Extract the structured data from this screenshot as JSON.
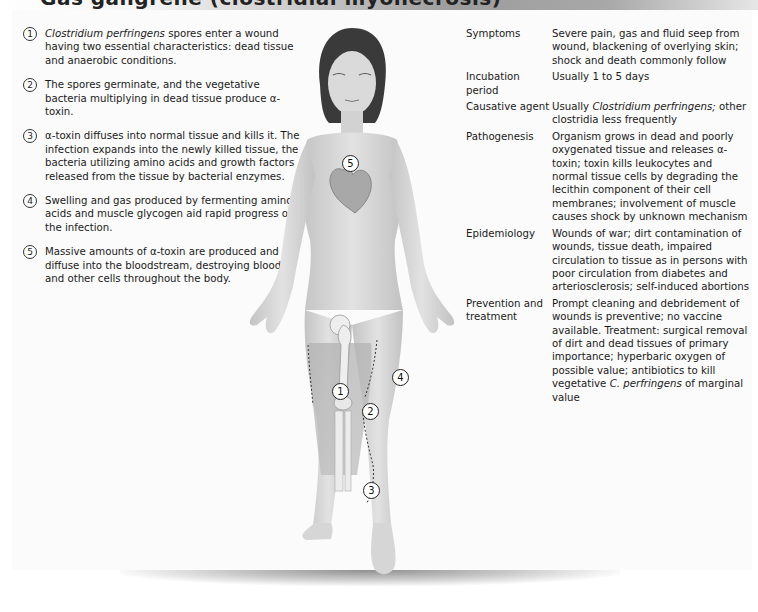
{
  "header": {
    "title": "Gas gangrene (clostridial myonecrosis)"
  },
  "steps": [
    {
      "num": "1",
      "italic": "Clostridium perfringens",
      "text": " spores enter a wound having two essential characteristics: dead tissue and anaerobic conditions."
    },
    {
      "num": "2",
      "italic": "",
      "text": "The spores germinate, and the vegetative bacteria multiplying in dead tissue produce α-toxin."
    },
    {
      "num": "3",
      "italic": "",
      "text": "α-toxin diffuses into normal tissue and kills it. The infection expands into the newly killed tissue, the bacteria utilizing amino acids and growth factors released from the tissue by bacterial enzymes."
    },
    {
      "num": "4",
      "italic": "",
      "text": "Swelling and gas produced by fermenting amino acids and muscle glycogen aid rapid progress of the infection."
    },
    {
      "num": "5",
      "italic": "",
      "text": "Massive amounts of α-toxin are produced and diffuse into the bloodstream, destroying blood and other cells throughout the body."
    }
  ],
  "info": [
    {
      "label": "Symptoms",
      "value": "Severe pain, gas and fluid seep from wound, blackening of overlying skin; shock and death commonly follow"
    },
    {
      "label": "Incubation period",
      "value": "Usually 1 to 5 days"
    },
    {
      "label": "Causative agent",
      "value_pre": "Usually ",
      "value_italic": "Clostridium perfringens;",
      "value_post": " other clostridia less frequently"
    },
    {
      "label": "Pathogenesis",
      "value": "Organism grows in dead and poorly oxygenated tissue and releases α-toxin; toxin kills leukocytes and normal tissue cells by degrading the lecithin component of their cell membranes; involvement of muscle causes shock by unknown mechanism"
    },
    {
      "label": "Epidemiology",
      "value": "Wounds of war; dirt contamination of wounds, tissue death, impaired circulation to tissue as in persons with poor circulation from diabetes and arteriosclerosis; self-induced abortions"
    },
    {
      "label": "Prevention and treatment",
      "value_pre": "Prompt cleaning and debridement of wounds is preventive; no vaccine available. Treatment: surgical removal of dirt and dead tissues of primary importance; hyperbaric oxygen of possible value; antibiotics to kill vegetative ",
      "value_italic": "C. perfringens",
      "value_post": " of marginal value"
    }
  ],
  "figure": {
    "markers": [
      {
        "num": "5",
        "location": "heart"
      },
      {
        "num": "1",
        "location": "thigh-wound"
      },
      {
        "num": "4",
        "location": "thigh-swelling"
      },
      {
        "num": "2",
        "location": "knee"
      },
      {
        "num": "3",
        "location": "lower-leg"
      }
    ]
  }
}
